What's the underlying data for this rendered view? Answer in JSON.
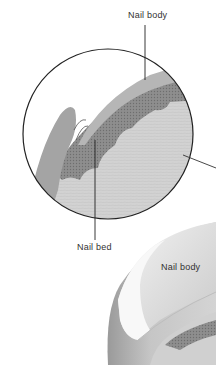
{
  "diagram": {
    "type": "anatomical-illustration",
    "labels": {
      "top_label": "Nail body",
      "bottom_label": "Nail bed",
      "nail_label": "Nail body"
    },
    "colors": {
      "background": "#ffffff",
      "outline": "#222222",
      "nail_plate": "#b8b8b8",
      "nail_bed_dark": "#8a8a8a",
      "dermis": "#cfcfcf",
      "skin_fold": "#a6a6a6",
      "nail_surface": "#e4e4e4",
      "nail_highlight": "#f7f7f7",
      "finger_skin": "#c2c2c2",
      "text": "#333333"
    }
  }
}
